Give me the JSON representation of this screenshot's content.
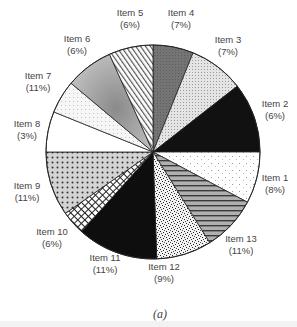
{
  "chart_data": {
    "type": "pie",
    "title": "",
    "caption": "(a)",
    "start_angle_deg": 0,
    "direction": "clockwise",
    "categories": [
      "Item 1",
      "Item 2",
      "Item 3",
      "Item 4",
      "Item 5",
      "Item 6",
      "Item 7",
      "Item 8",
      "Item 9",
      "Item 10",
      "Item 11",
      "Item 12",
      "Item 13"
    ],
    "values": [
      8,
      6,
      7,
      7,
      6,
      6,
      11,
      3,
      11,
      6,
      11,
      9,
      11
    ],
    "value_labels": [
      "(8%)",
      "(6%)",
      "(7%)",
      "(7%)",
      "(6%)",
      "(6%)",
      "(11%)",
      "(3%)",
      "(11%)",
      "(6%)",
      "(11%)",
      "(9%)",
      "(11%)"
    ],
    "slices": [
      {
        "name": "Item 4",
        "value": 7,
        "from": 0,
        "to": 22,
        "fill": "#6e6e6e",
        "pattern": "gray-dark",
        "label_x": 181,
        "label_y": 19
      },
      {
        "name": "Item 3",
        "value": 7,
        "from": 22,
        "to": 52,
        "fill": "#dcdcdc",
        "pattern": "fine-dots",
        "label_x": 228,
        "label_y": 46
      },
      {
        "name": "Item 2",
        "value": 6,
        "from": 52,
        "to": 90,
        "fill": "#111111",
        "pattern": "black",
        "label_x": 275,
        "label_y": 110
      },
      {
        "name": "Item 1",
        "value": 8,
        "from": 90,
        "to": 118,
        "fill": "#fafafa",
        "pattern": "sparse-dots",
        "label_x": 275,
        "label_y": 184
      },
      {
        "name": "Item 13",
        "value": 11,
        "from": 118,
        "to": 148,
        "fill": "#8a8a8a",
        "pattern": "h-stripes",
        "label_x": 241,
        "label_y": 245
      },
      {
        "name": "Item 12",
        "value": 9,
        "from": 148,
        "to": 178,
        "fill": "#e8e8e8",
        "pattern": "speckle",
        "label_x": 164,
        "label_y": 273
      },
      {
        "name": "Item 11",
        "value": 11,
        "from": 178,
        "to": 222,
        "fill": "#0e0e0e",
        "pattern": "black",
        "label_x": 105,
        "label_y": 264
      },
      {
        "name": "Item 10",
        "value": 6,
        "from": 222,
        "to": 235,
        "fill": "#ffffff",
        "pattern": "crosshatch",
        "label_x": 52,
        "label_y": 238
      },
      {
        "name": "Item 9",
        "value": 11,
        "from": 235,
        "to": 270,
        "fill": "#c8c8c8",
        "pattern": "dot-grid",
        "label_x": 27,
        "label_y": 192
      },
      {
        "name": "Item 8",
        "value": 3,
        "from": 270,
        "to": 292,
        "fill": "#ffffff",
        "pattern": "white",
        "label_x": 27,
        "label_y": 130
      },
      {
        "name": "Item 7",
        "value": 11,
        "from": 292,
        "to": 310,
        "fill": "#f0f0f0",
        "pattern": "light-dots",
        "label_x": 38,
        "label_y": 82
      },
      {
        "name": "Item 6",
        "value": 6,
        "from": 310,
        "to": 336,
        "fill": "#a8a8a8",
        "pattern": "gradient",
        "label_x": 77,
        "label_y": 45
      },
      {
        "name": "Item 5",
        "value": 6,
        "from": 336,
        "to": 360,
        "fill": "#ffffff",
        "pattern": "diag-stripes",
        "label_x": 130,
        "label_y": 19
      }
    ],
    "legend": "none",
    "center": [
      153,
      152
    ],
    "radius": 107
  }
}
